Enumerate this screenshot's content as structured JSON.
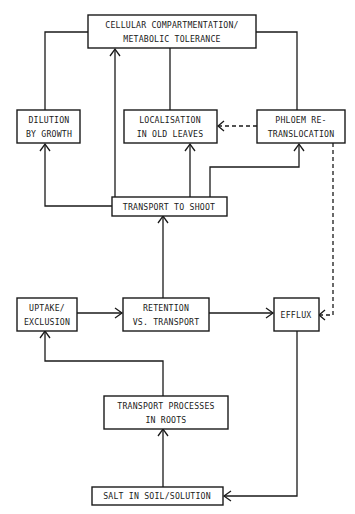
{
  "diagram": {
    "nodes": {
      "cellular": {
        "line1": "CELLULAR COMPARTMENTATION/",
        "line2": "METABOLIC TOLERANCE"
      },
      "dilution": {
        "line1": "DILUTION",
        "line2": "BY GROWTH"
      },
      "localisation": {
        "line1": "LOCALISATION",
        "line2": "IN OLD  LEAVES"
      },
      "phloem": {
        "line1": "PHLOEM RE-",
        "line2": "TRANSLOCATION"
      },
      "transport_shoot": {
        "line1": "TRANSPORT TO SHOOT"
      },
      "uptake": {
        "line1": "UPTAKE/",
        "line2": "EXCLUSION"
      },
      "retention": {
        "line1": "RETENTION",
        "line2": "VS. TRANSPORT"
      },
      "efflux": {
        "line1": "EFFLUX"
      },
      "transport_roots": {
        "line1": "TRANSPORT PROCESSES",
        "line2": "IN ROOTS"
      },
      "salt": {
        "line1": "SALT IN SOIL/SOLUTION"
      }
    },
    "edges": [
      {
        "from": "salt",
        "to": "transport_roots",
        "style": "solid"
      },
      {
        "from": "transport_roots",
        "to": "uptake",
        "style": "solid"
      },
      {
        "from": "uptake",
        "to": "retention",
        "style": "solid"
      },
      {
        "from": "retention",
        "to": "efflux",
        "style": "solid"
      },
      {
        "from": "retention",
        "to": "transport_shoot",
        "style": "solid"
      },
      {
        "from": "efflux",
        "to": "salt",
        "style": "solid"
      },
      {
        "from": "transport_shoot",
        "to": "dilution",
        "style": "solid"
      },
      {
        "from": "transport_shoot",
        "to": "cellular",
        "style": "solid"
      },
      {
        "from": "transport_shoot",
        "to": "localisation",
        "style": "solid"
      },
      {
        "from": "transport_shoot",
        "to": "phloem",
        "style": "solid"
      },
      {
        "from": "cellular",
        "to": "dilution",
        "style": "solid"
      },
      {
        "from": "cellular",
        "to": "localisation",
        "style": "solid"
      },
      {
        "from": "cellular",
        "to": "phloem",
        "style": "solid"
      },
      {
        "from": "phloem",
        "to": "localisation",
        "style": "dashed"
      },
      {
        "from": "phloem",
        "to": "efflux",
        "style": "dashed"
      }
    ]
  }
}
